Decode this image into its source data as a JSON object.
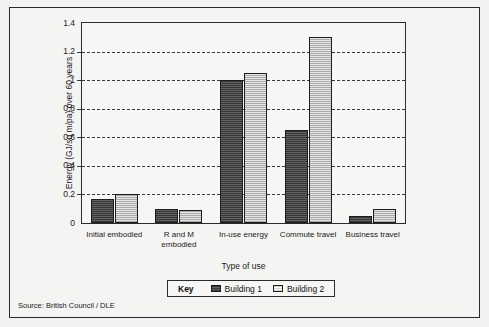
{
  "chart_data": {
    "type": "bar",
    "title": "",
    "xlabel": "Type of use",
    "ylabel": "Energy (GJ/sq m/pa) over 60 years",
    "ylim": [
      0,
      1.4
    ],
    "ytick_labels": [
      "1.4",
      "1.2",
      "1",
      "0.8",
      "0.6",
      "0.4",
      "0.2",
      "0"
    ],
    "ytick_values": [
      1.4,
      1.2,
      1.0,
      0.8,
      0.6,
      0.4,
      0.2,
      0
    ],
    "grid": "horizontal-dashed",
    "legend_position": "below-plot-center",
    "categories": [
      "Initial embodied",
      "R and M embodied",
      "In-use energy",
      "Commute travel",
      "Business travel"
    ],
    "series": [
      {
        "name": "Building 1",
        "color": "#4d4d4d",
        "values": [
          0.17,
          0.1,
          1.0,
          0.65,
          0.05
        ]
      },
      {
        "name": "Building 2",
        "color": "#c9c9c9",
        "values": [
          0.2,
          0.09,
          1.05,
          1.3,
          0.1
        ]
      }
    ]
  },
  "legend": {
    "key_word": "Key",
    "entries": [
      "Building 1",
      "Building 2"
    ]
  },
  "source": "Source: British Council / DLE"
}
